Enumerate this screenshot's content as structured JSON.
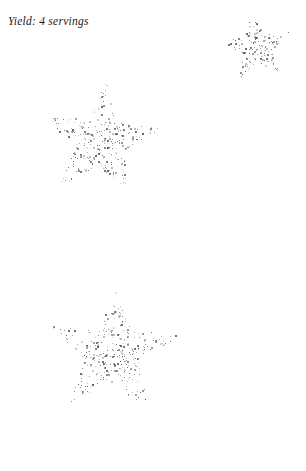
{
  "page": {
    "width": 306,
    "height": 471,
    "background": "#ffffff",
    "ink_color": "#3a3a42"
  },
  "header": {
    "yield_text": "Yield: 4 servings"
  },
  "figures": {
    "description": "three five-pointed stars drawn as scattered gray stipple dots",
    "count": 3,
    "stars": [
      {
        "name": "star-top-right",
        "cx": 256,
        "cy": 47,
        "outer_radius": 36,
        "inner_radius": 15,
        "rotation_deg": -8,
        "dot_count": 150,
        "seed": 1337
      },
      {
        "name": "star-middle-left",
        "cx": 100,
        "cy": 141,
        "outer_radius": 62,
        "inner_radius": 25,
        "rotation_deg": 6,
        "dot_count": 300,
        "seed": 24601
      },
      {
        "name": "star-bottom-left",
        "cx": 112,
        "cy": 352,
        "outer_radius": 70,
        "inner_radius": 28,
        "rotation_deg": 4,
        "dot_count": 330,
        "seed": 90210
      }
    ]
  }
}
